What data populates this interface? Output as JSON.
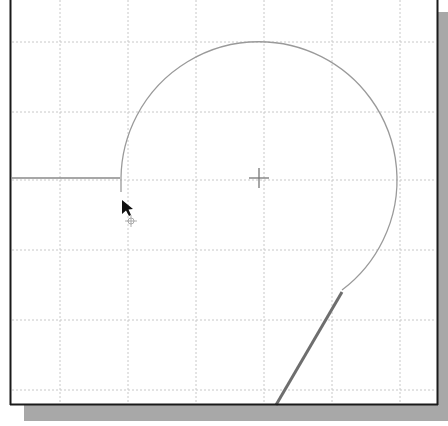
{
  "viewport": {
    "name": "drawing-viewport",
    "background": "#ffffff",
    "border_color": "#1a1a1a",
    "shadow_color": "#a8a8a8"
  },
  "grid": {
    "color": "#c8c8c8",
    "vertical_x": [
      60,
      128,
      196,
      264,
      332,
      400
    ],
    "horizontal_y": [
      42,
      112,
      180,
      250,
      320,
      390
    ]
  },
  "geometry": {
    "center_mark": {
      "x": 259,
      "y": 178,
      "size": 10,
      "color": "#777777"
    },
    "horizontal_line": {
      "x1": 12,
      "y1": 178,
      "x2": 120,
      "y2": 178,
      "color": "#8a8a8a"
    },
    "arc": {
      "cx": 259,
      "cy": 178,
      "r": 138,
      "start": {
        "x": 121,
        "y": 190
      },
      "end": {
        "x": 342,
        "y": 290
      },
      "color": "#9a9a9a"
    },
    "rubberband_line": {
      "x1": 342,
      "y1": 292,
      "x2": 276,
      "y2": 405,
      "color": "#6e6e6e"
    }
  },
  "cursor": {
    "x": 122,
    "y": 202,
    "type": "move-arrow"
  }
}
